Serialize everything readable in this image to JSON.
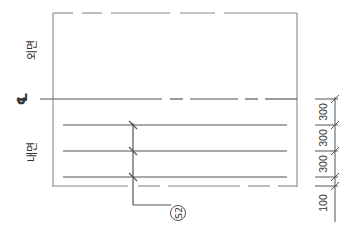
{
  "diagram": {
    "type": "reinforcement-section",
    "labels": {
      "outer_face": "외면",
      "inner_face": "내면",
      "centerline_symbol": "℄",
      "tag": "S2"
    },
    "dimensions": [
      "300",
      "300",
      "300",
      "100"
    ],
    "rebar_lines_count": 3,
    "colors": {
      "line": "#555555",
      "frame": "#888888",
      "background": "#ffffff"
    }
  }
}
